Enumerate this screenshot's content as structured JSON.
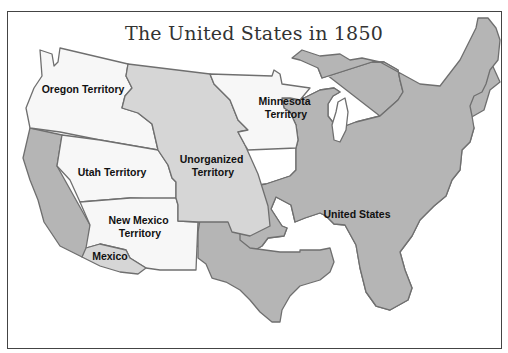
{
  "title": "The United States in 1850",
  "regions": [
    {
      "id": "oregon",
      "label_lines": [
        "Oregon Territory"
      ],
      "fill": "#f7f7f7"
    },
    {
      "id": "minnesota",
      "label_lines": [
        "Minnesota",
        "Territory"
      ],
      "fill": "#f7f7f7"
    },
    {
      "id": "utah",
      "label_lines": [
        "Utah Territory"
      ],
      "fill": "#f7f7f7"
    },
    {
      "id": "new-mexico",
      "label_lines": [
        "New Mexico",
        "Territory"
      ],
      "fill": "#f7f7f7"
    },
    {
      "id": "unorganized",
      "label_lines": [
        "Unorganized",
        "Territory"
      ],
      "fill": "#d6d6d6"
    },
    {
      "id": "united-states",
      "label_lines": [
        "United States"
      ],
      "fill": "#b5b5b5"
    },
    {
      "id": "mexico",
      "label_lines": [
        "Mexico"
      ],
      "fill": "#d6d6d6"
    }
  ],
  "colors": {
    "territory_fill": "#f7f7f7",
    "unorganized_fill": "#d6d6d6",
    "states_fill": "#b5b5b5",
    "border": "#6f6f6f"
  }
}
